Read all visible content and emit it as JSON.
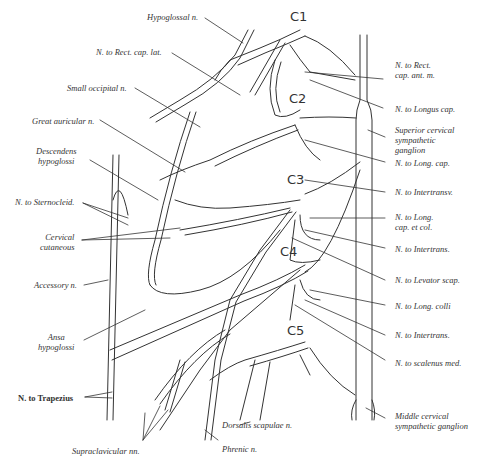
{
  "diagram": {
    "levels": [
      "C1",
      "C2",
      "C3",
      "C4",
      "C5"
    ],
    "left_labels": [
      "Hypoglossal n.",
      "N. to Rect. cap. lat.",
      "Small occipital n.",
      "Great auricular n.",
      "Descendens\nhypoglossi",
      "N. to Sternocleid.",
      "Cervical\ncutaneous",
      "Accessory n.",
      "Ansa\nhypoglossi",
      "N. to Trapezius"
    ],
    "right_labels": [
      "N. to Rect.\ncap. ant. m.",
      "N. to Longus cap.",
      "Superior cervical\nsympathetic\nganglion",
      "N. to Long. cap.",
      "N. to Intertransv.",
      "N. to Long.\ncap. et col.",
      "N. to Intertrans.",
      "N. to Levator scap.",
      "N. to Long. colli",
      "N. to Intertrans.",
      "N. to scalenus med.",
      "Middle cervical\nsympathetic ganglion"
    ],
    "bottom_labels": [
      "Supraclavicular nn.",
      "Dorsalis scapulae n.",
      "Phrenic n."
    ]
  }
}
